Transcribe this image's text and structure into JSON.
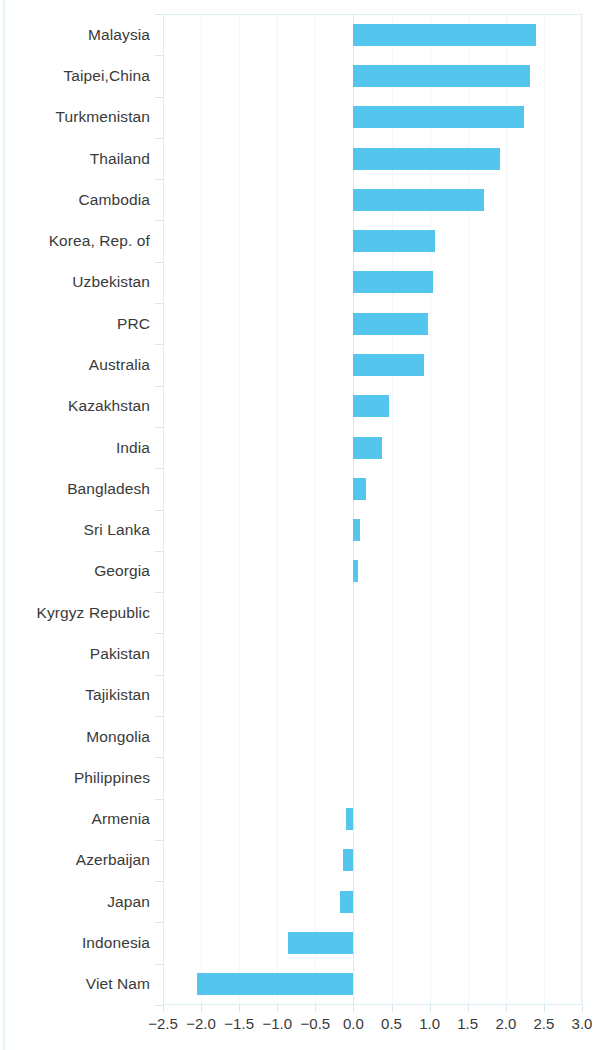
{
  "chart_data": {
    "type": "bar",
    "orientation": "horizontal",
    "title": "",
    "subtitle": "",
    "xlabel": "",
    "ylabel": "",
    "xlim": [
      -2.5,
      3.0
    ],
    "xticks": [
      -2.5,
      -2.0,
      -1.5,
      -1.0,
      -0.5,
      0.0,
      0.5,
      1.0,
      1.5,
      2.0,
      2.5,
      3.0
    ],
    "xtick_labels": [
      "−2.5",
      "−2.0",
      "−1.5",
      "−1.0",
      "−0.5",
      "0.0",
      "0.5",
      "1.0",
      "1.5",
      "2.0",
      "2.5",
      "3.0"
    ],
    "grid": true,
    "grid_axis": "x",
    "legend": false,
    "legend_position": "none",
    "bar_color": "#54c5ec",
    "zero_line_color": "#cfeaf4",
    "grid_color": "#eef7fb",
    "axis_color": "#ddeff5",
    "text_color": "#3a3a3a",
    "categories": [
      "Malaysia",
      "Taipei,China",
      "Turkmenistan",
      "Thailand",
      "Cambodia",
      "Korea, Rep. of",
      "Uzbekistan",
      "PRC",
      "Australia",
      "Kazakhstan",
      "India",
      "Bangladesh",
      "Sri Lanka",
      "Georgia",
      "Kyrgyz Republic",
      "Pakistan",
      "Tajikistan",
      "Mongolia",
      "Philippines",
      "Armenia",
      "Azerbaijan",
      "Japan",
      "Indonesia",
      "Viet Nam"
    ],
    "values": [
      2.4,
      2.32,
      2.24,
      1.93,
      1.72,
      1.07,
      1.04,
      0.98,
      0.92,
      0.47,
      0.38,
      0.17,
      0.09,
      0.06,
      0.0,
      0.0,
      0.0,
      0.0,
      0.0,
      -0.1,
      -0.14,
      -0.18,
      -0.86,
      -2.05
    ]
  }
}
